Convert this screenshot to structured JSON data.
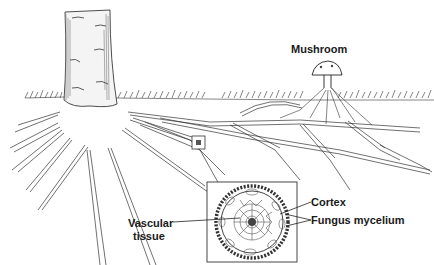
{
  "figure": {
    "type": "botanical line illustration",
    "labels": {
      "mushroom": "Mushroom",
      "cortex": "Cortex",
      "fungus_mycelium": "Fungus mycelium",
      "vascular_line1": "Vascular",
      "vascular_line2": "tissue"
    },
    "elements": {
      "tree": "tree-trunk",
      "ground": "grass-ground-line",
      "roots": "tree-roots",
      "mushroom": "mushroom-with-hyphae",
      "small_marker": "root-detail-marker-box",
      "inset": "root-cross-section-inset"
    },
    "colors": {
      "ink": "#1a1a1a",
      "background": "#ffffff"
    }
  }
}
